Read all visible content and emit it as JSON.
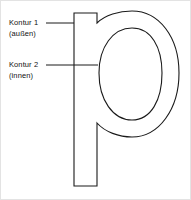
{
  "figure": {
    "type": "glyph-contour-diagram",
    "subject_glyph": "p",
    "background_color": "#ffffff",
    "stroke_color": "#1a1a1a",
    "border_color": "#e3e3e3",
    "text_color": "#111111"
  },
  "annotations": [
    {
      "id": "kontur-1",
      "title": "Kontur 1",
      "subtitle": "(außen)",
      "leader": {
        "x1": 45,
        "y1": 22,
        "x2": 73,
        "y2": 22
      }
    },
    {
      "id": "kontur-2",
      "title": "Kontur 2",
      "subtitle": "(innen)",
      "leader": {
        "x1": 45,
        "y1": 64,
        "x2": 97,
        "y2": 64
      }
    }
  ],
  "glyph": {
    "outer_contour_label": "Kontur 1 (außen)",
    "inner_contour_label": "Kontur 2 (innen)",
    "outer_path": "M 73 12 L 96 12 L 96 22 C 104 14 118 10 131 10 C 158 10 178 36 178 72 C 178 108 158 136 131 136 C 118 136 104 131 96 122 L 96 185 L 73 185 Z",
    "inner_path": "M 131 27 C 150 27 161 46 161 72 C 161 99 150 119 131 119 C 112 119 98 99 98 72 C 98 46 112 27 131 27 Z"
  }
}
